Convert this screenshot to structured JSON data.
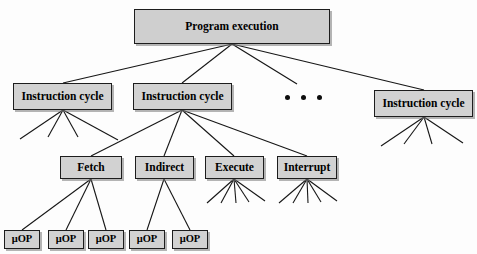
{
  "diagram": {
    "colors": {
      "node_fill": "#d2d2d2",
      "node_border": "#1d1d1d",
      "edge": "#161616",
      "background": "#ffffff",
      "text": "#000000"
    },
    "levels": {
      "level0_label": "Program execution",
      "level1_label": "Instruction cycle",
      "level2_label": "Phase",
      "level3_label": "Micro-operation"
    },
    "nodes": {
      "root": {
        "id": "program-execution",
        "label": "Program execution",
        "x": 134,
        "y": 9,
        "w": 196,
        "h": 35
      },
      "cycles": [
        {
          "id": "instruction-cycle-1",
          "label": "Instruction cycle",
          "x": 13,
          "y": 83,
          "w": 99,
          "h": 27
        },
        {
          "id": "instruction-cycle-2",
          "label": "Instruction cycle",
          "x": 133,
          "y": 83,
          "w": 99,
          "h": 27
        },
        {
          "id": "instruction-cycle-3",
          "label": "Instruction cycle",
          "x": 374,
          "y": 90,
          "w": 99,
          "h": 27
        }
      ],
      "phases": [
        {
          "id": "fetch",
          "label": "Fetch",
          "x": 60,
          "y": 156,
          "w": 62,
          "h": 23
        },
        {
          "id": "indirect",
          "label": "Indirect",
          "x": 135,
          "y": 156,
          "w": 59,
          "h": 23
        },
        {
          "id": "execute",
          "label": "Execute",
          "x": 205,
          "y": 156,
          "w": 59,
          "h": 23
        },
        {
          "id": "interrupt",
          "label": "Interrupt",
          "x": 277,
          "y": 156,
          "w": 60,
          "h": 23
        }
      ],
      "micro_ops": [
        {
          "id": "uop-1",
          "label": "μOP",
          "x": 4,
          "y": 230,
          "w": 36,
          "h": 19,
          "parent": "fetch"
        },
        {
          "id": "uop-2",
          "label": "μOP",
          "x": 48,
          "y": 230,
          "w": 36,
          "h": 19,
          "parent": "fetch"
        },
        {
          "id": "uop-3",
          "label": "μOP",
          "x": 88,
          "y": 230,
          "w": 36,
          "h": 19,
          "parent": "fetch"
        },
        {
          "id": "uop-4",
          "label": "μOP",
          "x": 129,
          "y": 230,
          "w": 36,
          "h": 19,
          "parent": "indirect"
        },
        {
          "id": "uop-5",
          "label": "μOP",
          "x": 172,
          "y": 230,
          "w": 36,
          "h": 19,
          "parent": "indirect"
        }
      ]
    },
    "ellipsis": {
      "id": "cycles-ellipsis",
      "label": "• • •",
      "dot_count": 3,
      "x": 285,
      "y": 95
    },
    "edges": {
      "root_to_cycles": [
        {
          "from": "program-execution",
          "to": "instruction-cycle-1",
          "x1": 232,
          "y1": 44,
          "x2": 63,
          "y2": 83
        },
        {
          "from": "program-execution",
          "to": "instruction-cycle-2",
          "x1": 232,
          "y1": 44,
          "x2": 182,
          "y2": 83
        },
        {
          "from": "program-execution",
          "to": "ellipsis",
          "x1": 232,
          "y1": 44,
          "x2": 297,
          "y2": 84
        },
        {
          "from": "program-execution",
          "to": "instruction-cycle-3",
          "x1": 232,
          "y1": 44,
          "x2": 424,
          "y2": 90
        }
      ],
      "cycle2_to_phases": [
        {
          "from": "instruction-cycle-2",
          "to": "fetch",
          "x1": 182,
          "y1": 110,
          "x2": 91,
          "y2": 156
        },
        {
          "from": "instruction-cycle-2",
          "to": "indirect",
          "x1": 182,
          "y1": 110,
          "x2": 164,
          "y2": 156
        },
        {
          "from": "instruction-cycle-2",
          "to": "execute",
          "x1": 182,
          "y1": 110,
          "x2": 234,
          "y2": 156
        },
        {
          "from": "instruction-cycle-2",
          "to": "interrupt",
          "x1": 182,
          "y1": 110,
          "x2": 307,
          "y2": 156
        }
      ],
      "fetch_to_uops": [
        {
          "from": "fetch",
          "to": "uop-1",
          "x1": 91,
          "y1": 179,
          "x2": 22,
          "y2": 230
        },
        {
          "from": "fetch",
          "to": "uop-2",
          "x1": 91,
          "y1": 179,
          "x2": 66,
          "y2": 230
        },
        {
          "from": "fetch",
          "to": "uop-3",
          "x1": 91,
          "y1": 179,
          "x2": 106,
          "y2": 230
        }
      ],
      "indirect_to_uops": [
        {
          "from": "indirect",
          "to": "uop-4",
          "x1": 164,
          "y1": 179,
          "x2": 147,
          "y2": 230
        },
        {
          "from": "indirect",
          "to": "uop-5",
          "x1": 164,
          "y1": 179,
          "x2": 190,
          "y2": 230
        }
      ],
      "stubs": {
        "instruction-cycle-1": {
          "apex_x": 63,
          "apex_y": 110,
          "count": 4,
          "ends": [
            [
              20,
              139
            ],
            [
              48,
              137
            ],
            [
              78,
              137
            ],
            [
              118,
              140
            ]
          ]
        },
        "instruction-cycle-3": {
          "apex_x": 424,
          "apex_y": 117,
          "count": 4,
          "ends": [
            [
              381,
              146
            ],
            [
              404,
              144
            ],
            [
              432,
              144
            ],
            [
              463,
              143
            ]
          ]
        },
        "execute": {
          "apex_x": 234,
          "apex_y": 179,
          "count": 5,
          "ends": [
            [
              207,
              203
            ],
            [
              221,
              203
            ],
            [
              236,
              203
            ],
            [
              249,
              202
            ],
            [
              265,
              201
            ]
          ]
        },
        "interrupt": {
          "apex_x": 307,
          "apex_y": 179,
          "count": 5,
          "ends": [
            [
              279,
              203
            ],
            [
              293,
              203
            ],
            [
              308,
              203
            ],
            [
              321,
              202
            ],
            [
              337,
              201
            ]
          ]
        }
      }
    }
  }
}
